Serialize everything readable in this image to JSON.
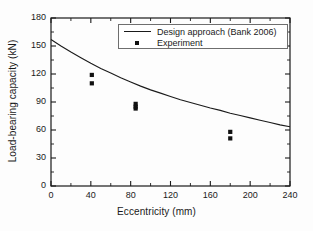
{
  "chart_data": {
    "type": "scatter",
    "title": "",
    "xlabel": "Eccentricity (mm)",
    "ylabel": "Load-bearing capacity (kN)",
    "xlim": [
      0,
      240
    ],
    "ylim": [
      0,
      180
    ],
    "xticks": [
      0,
      40,
      80,
      120,
      160,
      200,
      240
    ],
    "yticks": [
      0,
      30,
      60,
      90,
      120,
      150,
      180
    ],
    "xtick_labels": [
      "0",
      "40",
      "80",
      "120",
      "160",
      "200",
      "240"
    ],
    "ytick_labels": [
      "0",
      "30",
      "60",
      "90",
      "120",
      "150",
      "180"
    ],
    "minor_ticks": true,
    "grid": false,
    "legend_position": "top-right",
    "series": [
      {
        "name": "Design approach (Bank 2006)",
        "type": "line",
        "color": "#1a1a1a",
        "x": [
          0,
          10,
          20,
          30,
          40,
          50,
          60,
          70,
          80,
          90,
          100,
          110,
          120,
          130,
          140,
          150,
          160,
          170,
          180,
          190,
          200,
          210,
          220,
          230,
          240
        ],
        "y": [
          157,
          150,
          143.5,
          137.5,
          131.5,
          126,
          121,
          116,
          111.5,
          107,
          103,
          99.5,
          96,
          92.5,
          89.5,
          86.5,
          83.5,
          81,
          78,
          75.5,
          73,
          70.5,
          68,
          65.5,
          63.5
        ]
      },
      {
        "name": "Experiment",
        "type": "scatter",
        "color": "#111111",
        "marker": "square",
        "x": [
          41,
          41,
          85,
          85,
          85,
          180,
          180
        ],
        "y": [
          119,
          110,
          88,
          85,
          83,
          58,
          51
        ]
      }
    ]
  },
  "legend": {
    "entries": [
      {
        "label": "Design approach (Bank 2006)",
        "key": "line"
      },
      {
        "label": "Experiment",
        "key": "marker"
      }
    ]
  }
}
